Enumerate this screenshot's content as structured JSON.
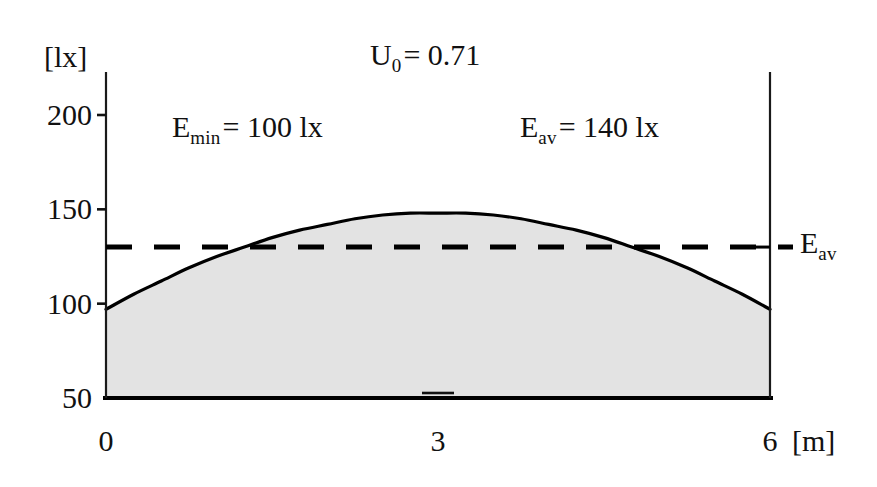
{
  "chart_data": {
    "type": "area",
    "title": "",
    "subtitle": "",
    "xlabel": "[m]",
    "ylabel": "[lx]",
    "xlim": [
      0,
      6
    ],
    "ylim": [
      50,
      215
    ],
    "grid": false,
    "legend_position": "none",
    "x_ticks": [
      {
        "value": 0,
        "label": "0"
      },
      {
        "value": 3,
        "label": "3"
      },
      {
        "value": 6,
        "label": "6"
      }
    ],
    "y_ticks": [
      {
        "value": 200,
        "label": "200"
      },
      {
        "value": 150,
        "label": "150"
      },
      {
        "value": 100,
        "label": "100"
      },
      {
        "value": 50,
        "label": "50"
      }
    ],
    "series": [
      {
        "name": "Illuminance E",
        "style": "solid-line-with-shaded-fill",
        "fill_color": "#e3e3e3",
        "line_color": "#000000",
        "x": [
          0.0,
          0.25,
          0.5,
          0.75,
          1.0,
          1.25,
          1.5,
          1.75,
          2.0,
          2.25,
          2.5,
          2.75,
          3.0,
          3.25,
          3.5,
          3.75,
          4.0,
          4.25,
          4.5,
          4.75,
          5.0,
          5.25,
          5.5,
          5.75,
          6.0
        ],
        "values": [
          97,
          105,
          112,
          119,
          125,
          130,
          135,
          139,
          142,
          145,
          147,
          148,
          148,
          148,
          147,
          145,
          142,
          139,
          135,
          130,
          125,
          119,
          112,
          105,
          97
        ]
      },
      {
        "name": "E_av reference line",
        "style": "dashed-horizontal",
        "line_color": "#000000",
        "value": 130,
        "label": "E"
      }
    ],
    "annotations": [
      {
        "name": "uniformity",
        "text_main": "U",
        "subscript": "0",
        "text_tail": "= 0.71",
        "x": 3.02,
        "y": 205
      },
      {
        "name": "e-min",
        "text_main": "E",
        "subscript": "min",
        "text_tail": "= 100 lx",
        "x": 1.1,
        "y": 188
      },
      {
        "name": "e-av",
        "text_main": "E",
        "subscript": "av",
        "text_tail": "= 140 lx",
        "x": 4.1,
        "y": 188
      },
      {
        "name": "e-av-line-label",
        "text_main": "E",
        "subscript": "av",
        "text_tail": "",
        "x": 6.35,
        "y": 135
      }
    ]
  },
  "axes": {
    "y_unit": "[lx]",
    "x_unit": "[m]",
    "y_tick_labels": [
      "200",
      "150",
      "100",
      "50"
    ],
    "x_tick_labels": [
      "0",
      "3",
      "6"
    ]
  },
  "annotations": {
    "uniformity": {
      "symbol": "U",
      "sub": "0",
      "rest": "= 0.71"
    },
    "e_min": {
      "symbol": "E",
      "sub": "min",
      "rest": "= 100 lx"
    },
    "e_av": {
      "symbol": "E",
      "sub": "av",
      "rest": "= 140 lx"
    },
    "e_av_line": {
      "symbol": "E",
      "sub": "av",
      "rest": ""
    }
  },
  "colors": {
    "fill": "#e3e3e3",
    "line": "#000000",
    "text": "#111111"
  }
}
